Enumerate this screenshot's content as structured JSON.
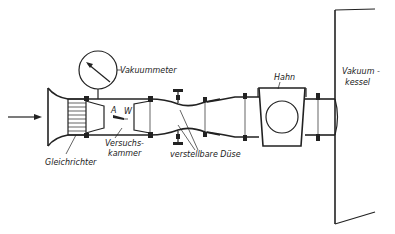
{
  "diagram": {
    "type": "schematic",
    "flow_direction": "left-to-right",
    "labels": {
      "vakuummeter": "Vakuummeter",
      "gleichrichter": "Gleichrichter",
      "versuchskammer_1": "Versuchs-",
      "versuchskammer_2": "kammer",
      "verstellbare_duese": "verstellbare Düse",
      "hahn": "Hahn",
      "vakuumkessel_1": "Vakuum -",
      "vakuumkessel_2": "kessel",
      "point_a": "A",
      "point_w": "W"
    },
    "components": [
      {
        "id": "inlet-arrow",
        "label": ""
      },
      {
        "id": "inlet-nozzle",
        "label": ""
      },
      {
        "id": "flow-straightener",
        "label": "Gleichrichter"
      },
      {
        "id": "vacuum-gauge",
        "label": "Vakuummeter"
      },
      {
        "id": "test-chamber",
        "label": "Versuchskammer"
      },
      {
        "id": "adjustable-nozzle",
        "label": "verstellbare Düse"
      },
      {
        "id": "valve",
        "label": "Hahn"
      },
      {
        "id": "vacuum-tank",
        "label": "Vakuumkessel"
      }
    ],
    "colors": {
      "ink": "#222222",
      "background": "#ffffff"
    }
  }
}
